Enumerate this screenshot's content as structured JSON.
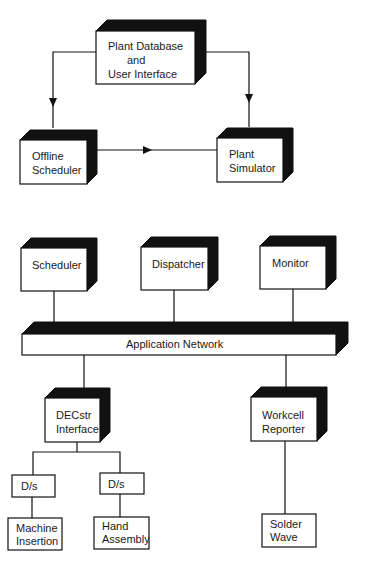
{
  "diagram": {
    "title": "",
    "colors": {
      "ink": "#111111",
      "face": "#ffffff",
      "shadow": "#111111",
      "background": "#ffffff"
    },
    "upper_section": {
      "nodes": {
        "plant_database": {
          "lines": [
            "Plant    Database",
            "and",
            "User Interface"
          ]
        },
        "offline_scheduler": {
          "lines": [
            "Offline",
            "Scheduler"
          ]
        },
        "plant_simulator": {
          "lines": [
            "Plant",
            "Simulator"
          ]
        }
      },
      "edges": [
        {
          "from": "plant_database",
          "to": "offline_scheduler",
          "directed": true
        },
        {
          "from": "plant_database",
          "to": "plant_simulator",
          "directed": true
        },
        {
          "from": "offline_scheduler",
          "to": "plant_simulator",
          "directed": true
        }
      ]
    },
    "lower_section": {
      "nodes": {
        "scheduler": {
          "lines": [
            "Scheduler"
          ]
        },
        "dispatcher": {
          "lines": [
            "Dispatcher"
          ]
        },
        "monitor": {
          "lines": [
            "Monitor"
          ]
        },
        "network": {
          "lines": [
            "Application        Network"
          ]
        },
        "decstr_interface": {
          "lines": [
            "DECstr",
            "Interface"
          ]
        },
        "workcell_reporter": {
          "lines": [
            "Workcell",
            "Reporter"
          ]
        },
        "ds_left": {
          "lines": [
            "D/s"
          ]
        },
        "ds_right": {
          "lines": [
            "D/s"
          ]
        },
        "machine_insertion": {
          "lines": [
            "Machine",
            "Insertion"
          ]
        },
        "hand_assembly": {
          "lines": [
            "Hand",
            "Assembly"
          ]
        },
        "solder_wave": {
          "lines": [
            "Solder",
            "Wave"
          ]
        }
      },
      "edges": [
        {
          "from": "scheduler",
          "to": "network",
          "directed": false
        },
        {
          "from": "dispatcher",
          "to": "network",
          "directed": false
        },
        {
          "from": "monitor",
          "to": "network",
          "directed": false
        },
        {
          "from": "network",
          "to": "decstr_interface",
          "directed": false
        },
        {
          "from": "network",
          "to": "workcell_reporter",
          "directed": false
        },
        {
          "from": "decstr_interface",
          "to": "ds_left",
          "directed": false
        },
        {
          "from": "decstr_interface",
          "to": "ds_right",
          "directed": false
        },
        {
          "from": "ds_left",
          "to": "machine_insertion",
          "directed": false
        },
        {
          "from": "ds_right",
          "to": "hand_assembly",
          "directed": false
        },
        {
          "from": "workcell_reporter",
          "to": "solder_wave",
          "directed": false
        }
      ]
    }
  }
}
